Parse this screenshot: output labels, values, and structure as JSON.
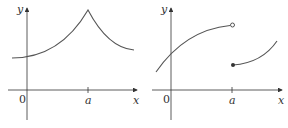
{
  "figures": [
    {
      "name": "continuous-cusp-graph",
      "axis_labels": {
        "x": "x",
        "y": "y"
      },
      "tick_labels": {
        "origin": "0",
        "a": "a"
      },
      "description": "Continuous curve rising to a sharp peak (cusp) at x = a, then decreasing"
    },
    {
      "name": "jump-discontinuity-graph",
      "axis_labels": {
        "x": "x",
        "y": "y"
      },
      "tick_labels": {
        "origin": "0",
        "a": "a"
      },
      "description": "Curve increasing to an open circle at x = a; second piece starts with a filled dot lower at x = a and increases"
    }
  ],
  "colors": {
    "axis": "#333333",
    "curve": "#555555"
  }
}
